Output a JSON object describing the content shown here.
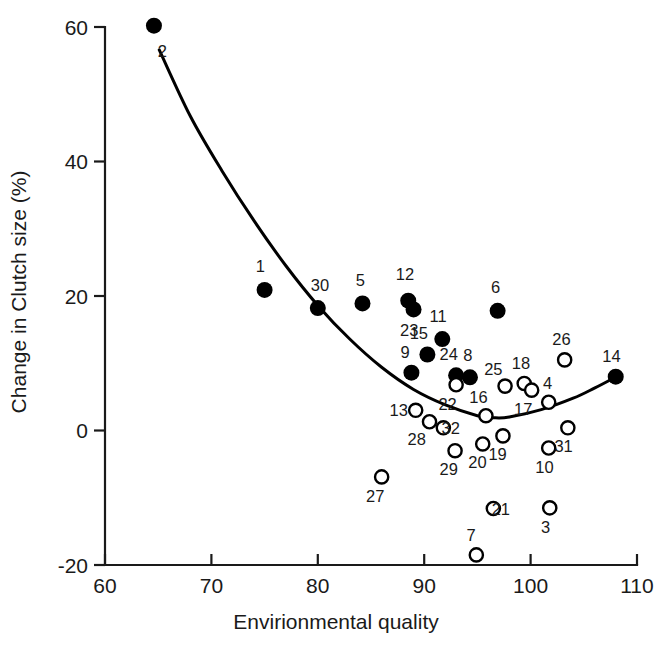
{
  "chart_data": {
    "type": "scatter",
    "title": "",
    "xlabel": "Envirionmental quality",
    "ylabel": "Change in Clutch size (%)",
    "xlim": [
      60,
      110
    ],
    "ylim": [
      -20,
      60
    ],
    "xticks": [
      60,
      70,
      80,
      90,
      100,
      110
    ],
    "yticks": [
      -20,
      0,
      20,
      40,
      60
    ],
    "xtick_labels": [
      "60",
      "70",
      "80",
      "90",
      "100",
      "110"
    ],
    "ytick_labels": [
      "-20",
      "0",
      "20",
      "40",
      "60"
    ],
    "grid": false,
    "legend": "none",
    "marker_styles": {
      "filled": "filled black circle",
      "open": "open white circle with black outline"
    },
    "points": [
      {
        "label": "2",
        "x": 64.6,
        "y": 60.2,
        "style": "filled",
        "lx": 65.4,
        "ly": 56.5
      },
      {
        "label": "1",
        "x": 75.0,
        "y": 20.9,
        "style": "filled",
        "lx": 74.6,
        "ly": 24.4
      },
      {
        "label": "30",
        "x": 80.0,
        "y": 18.2,
        "style": "filled",
        "lx": 80.2,
        "ly": 21.6
      },
      {
        "label": "5",
        "x": 84.2,
        "y": 18.9,
        "style": "filled",
        "lx": 84.0,
        "ly": 22.4
      },
      {
        "label": "12",
        "x": 88.5,
        "y": 19.3,
        "style": "filled",
        "lx": 88.2,
        "ly": 23.2
      },
      {
        "label": "23",
        "x": 89.0,
        "y": 18.0,
        "style": "filled",
        "lx": 88.6,
        "ly": 15.0
      },
      {
        "label": "11",
        "x": 91.7,
        "y": 13.6,
        "style": "filled",
        "lx": 91.3,
        "ly": 17.0
      },
      {
        "label": "15",
        "x": 90.3,
        "y": 11.3,
        "style": "filled",
        "lx": 89.5,
        "ly": 14.5
      },
      {
        "label": "6",
        "x": 96.9,
        "y": 17.8,
        "style": "filled",
        "lx": 96.7,
        "ly": 21.3
      },
      {
        "label": "9",
        "x": 88.8,
        "y": 8.6,
        "style": "filled",
        "lx": 88.2,
        "ly": 11.6
      },
      {
        "label": "24",
        "x": 93.0,
        "y": 8.2,
        "style": "filled",
        "lx": 92.3,
        "ly": 11.4
      },
      {
        "label": "8",
        "x": 94.3,
        "y": 7.9,
        "style": "filled",
        "lx": 94.1,
        "ly": 11.2
      },
      {
        "label": "22",
        "x": 93.0,
        "y": 6.8,
        "style": "open",
        "lx": 92.2,
        "ly": 4.0
      },
      {
        "label": "25",
        "x": 97.6,
        "y": 6.6,
        "style": "open",
        "lx": 96.5,
        "ly": 9.2
      },
      {
        "label": "18",
        "x": 99.4,
        "y": 7.0,
        "style": "open",
        "lx": 99.1,
        "ly": 10.0
      },
      {
        "label": "17",
        "x": 100.1,
        "y": 6.0,
        "style": "open",
        "lx": 99.3,
        "ly": 3.2
      },
      {
        "label": "4",
        "x": 101.7,
        "y": 4.2,
        "style": "open",
        "lx": 101.6,
        "ly": 7.0
      },
      {
        "label": "26",
        "x": 103.2,
        "y": 10.5,
        "style": "open",
        "lx": 102.9,
        "ly": 13.6
      },
      {
        "label": "14",
        "x": 108.0,
        "y": 8.0,
        "style": "filled",
        "lx": 107.6,
        "ly": 11.1
      },
      {
        "label": "16",
        "x": 95.8,
        "y": 2.2,
        "style": "open",
        "lx": 95.1,
        "ly": 5.0
      },
      {
        "label": "13",
        "x": 89.2,
        "y": 3.0,
        "style": "open",
        "lx": 87.6,
        "ly": 3.1
      },
      {
        "label": "28",
        "x": 90.5,
        "y": 1.3,
        "style": "open",
        "lx": 89.3,
        "ly": -1.2
      },
      {
        "label": "32",
        "x": 91.8,
        "y": 0.4,
        "style": "open",
        "lx": 92.5,
        "ly": 0.4
      },
      {
        "label": "29",
        "x": 92.9,
        "y": -3.0,
        "style": "open",
        "lx": 92.3,
        "ly": -5.7
      },
      {
        "label": "20",
        "x": 95.5,
        "y": -2.0,
        "style": "open",
        "lx": 95.0,
        "ly": -4.7
      },
      {
        "label": "19",
        "x": 97.4,
        "y": -0.8,
        "style": "open",
        "lx": 96.9,
        "ly": -3.5
      },
      {
        "label": "10",
        "x": 101.7,
        "y": -2.6,
        "style": "open",
        "lx": 101.3,
        "ly": -5.4
      },
      {
        "label": "31",
        "x": 103.5,
        "y": 0.4,
        "style": "open",
        "lx": 103.1,
        "ly": -2.3
      },
      {
        "label": "27",
        "x": 86.0,
        "y": -6.9,
        "style": "open",
        "lx": 85.4,
        "ly": -9.8
      },
      {
        "label": "21",
        "x": 96.5,
        "y": -11.6,
        "style": "open",
        "lx": 97.2,
        "ly": -11.6
      },
      {
        "label": "3",
        "x": 101.8,
        "y": -11.5,
        "style": "open",
        "lx": 101.4,
        "ly": -14.4
      },
      {
        "label": "7",
        "x": 94.9,
        "y": -18.5,
        "style": "open",
        "lx": 94.4,
        "ly": -15.6
      }
    ],
    "fit_curve": {
      "description": "quadratic fit of clutch size change vs environmental quality",
      "x_start": 65.1,
      "x_end": 108.3,
      "points": [
        {
          "x": 65.1,
          "y": 56.6
        },
        {
          "x": 68.0,
          "y": 46.8
        },
        {
          "x": 71.0,
          "y": 38.6
        },
        {
          "x": 74.0,
          "y": 31.2
        },
        {
          "x": 77.0,
          "y": 24.5
        },
        {
          "x": 80.0,
          "y": 18.6
        },
        {
          "x": 83.0,
          "y": 13.6
        },
        {
          "x": 86.0,
          "y": 9.4
        },
        {
          "x": 89.0,
          "y": 6.1
        },
        {
          "x": 92.0,
          "y": 3.8
        },
        {
          "x": 95.0,
          "y": 2.2
        },
        {
          "x": 96.5,
          "y": 1.9
        },
        {
          "x": 98.0,
          "y": 2.0
        },
        {
          "x": 101.0,
          "y": 3.1
        },
        {
          "x": 104.0,
          "y": 4.8
        },
        {
          "x": 106.0,
          "y": 6.3
        },
        {
          "x": 108.3,
          "y": 8.2
        }
      ]
    }
  }
}
